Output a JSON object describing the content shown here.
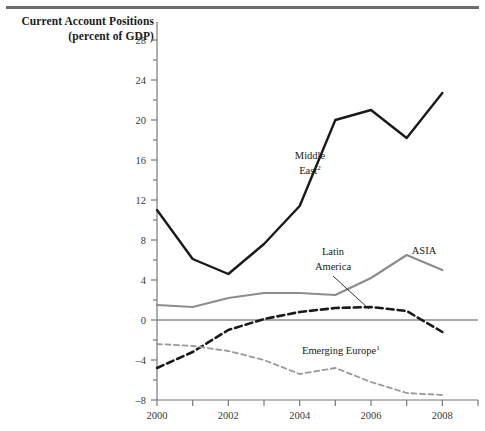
{
  "figure": {
    "title_line1": "Current Account Positions",
    "title_line2": "(percent of GDP)"
  },
  "labels": {
    "middle_east_l1": "Middle",
    "middle_east_l2": "East",
    "middle_east_sup": "2",
    "latin_america_l1": "Latin",
    "latin_america_l2": "America",
    "asia": "ASIA",
    "emerging_europe": "Emerging Europe",
    "emerging_europe_sup": "1"
  },
  "colors": {
    "middle_east": "#1a1a1a",
    "asia": "#8c8c8c",
    "latin_america": "#1a1a1a",
    "emerging_europe": "#9a9a9a",
    "axis": "#777777",
    "zero_line": "#8c8c8c",
    "rule": "#6d6d6d"
  },
  "chart_data": {
    "type": "line",
    "title": "Current Account Positions (percent of GDP)",
    "xlabel": "",
    "ylabel": "percent of GDP",
    "xlim": [
      2000,
      2009
    ],
    "ylim": [
      -8,
      30
    ],
    "yticks": [
      -8,
      -4,
      0,
      4,
      8,
      12,
      16,
      20,
      24,
      28
    ],
    "ytick_labels": [
      "–8",
      "–4",
      "0",
      "4",
      "8",
      "12",
      "16",
      "20",
      "24",
      "28"
    ],
    "ytick_minor_step": 2,
    "xticks": [
      2000,
      2001,
      2002,
      2003,
      2004,
      2005,
      2006,
      2007,
      2008,
      2009
    ],
    "xtick_labels": [
      "2000",
      "",
      "2002",
      "",
      "2004",
      "",
      "2006",
      "",
      "2008",
      ""
    ],
    "grid": false,
    "legend": "inline-annotations",
    "x": [
      2000,
      2001,
      2002,
      2003,
      2004,
      2005,
      2006,
      2007,
      2008
    ],
    "series": [
      {
        "name": "Middle East",
        "style": "solid",
        "color": "#1a1a1a",
        "width": 2.4,
        "values": [
          11.0,
          6.1,
          4.6,
          7.6,
          11.4,
          20.0,
          21.0,
          18.2,
          22.7
        ]
      },
      {
        "name": "ASIA",
        "style": "solid",
        "color": "#8c8c8c",
        "width": 2.2,
        "values": [
          1.5,
          1.3,
          2.2,
          2.7,
          2.7,
          2.5,
          4.2,
          6.5,
          5.0
        ]
      },
      {
        "name": "Latin America",
        "style": "dashed",
        "color": "#1a1a1a",
        "width": 2.6,
        "values": [
          -4.8,
          -3.2,
          -1.0,
          0.1,
          0.8,
          1.2,
          1.3,
          0.9,
          -1.2
        ]
      },
      {
        "name": "Emerging Europe",
        "style": "dashed",
        "color": "#9a9a9a",
        "width": 1.8,
        "values": [
          -2.4,
          -2.6,
          -3.1,
          -4.0,
          -5.4,
          -4.8,
          -6.2,
          -7.3,
          -7.5
        ]
      }
    ],
    "annotations": [
      {
        "text": "Middle East2",
        "x": 2003.5,
        "y": 16.6
      },
      {
        "text": "Latin America",
        "x": 2005.0,
        "y": 7.3,
        "leader_to": {
          "x": 2006.0,
          "y": 1.3
        }
      },
      {
        "text": "ASIA",
        "x": 2007.1,
        "y": 7.4
      },
      {
        "text": "Emerging Europe1",
        "x": 2005.6,
        "y": -2.6
      }
    ]
  }
}
